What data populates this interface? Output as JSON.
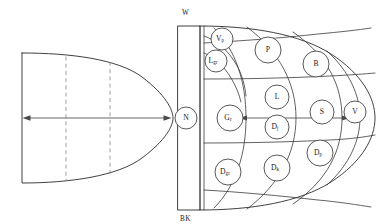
{
  "figure": {
    "caption": "",
    "panels": [
      {
        "id": "left-panel",
        "name": "outline-shape-panel",
        "description": "Rounded-nose outline with two vertical dashed division lines and a horizontal double-headed width arrow"
      },
      {
        "id": "right-panel",
        "name": "segmented-node-panel",
        "description": "Rounded-nose outline subdivided by curved arcs into cells, each containing a labelled circular node, with a left vertical band"
      }
    ]
  },
  "left_diagram": {
    "dashed_line_count": 2,
    "arrow": {
      "type": "double-headed",
      "orientation": "horizontal",
      "label": ""
    }
  },
  "right_diagram": {
    "band_label_top": "W",
    "band_label_bottom": "BK",
    "arrow": {
      "type": "double-headed",
      "orientation": "horizontal",
      "from_node": "G",
      "through_node": "S",
      "to_node": "V"
    },
    "nodes": [
      {
        "id": "n",
        "base": "N",
        "sub": "",
        "cx": 186,
        "cy": 118
      },
      {
        "id": "vp",
        "base": "V",
        "sub": "p",
        "cx": 222,
        "cy": 39
      },
      {
        "id": "lgr",
        "base": "L",
        "sub": "gr",
        "cx": 216,
        "cy": 61
      },
      {
        "id": "p",
        "base": "P",
        "sub": "",
        "cx": 268,
        "cy": 50
      },
      {
        "id": "b",
        "base": "B",
        "sub": "",
        "cx": 316,
        "cy": 64
      },
      {
        "id": "gr",
        "base": "G",
        "sub": "r",
        "cx": 230,
        "cy": 118
      },
      {
        "id": "l",
        "base": "L",
        "sub": "",
        "cx": 277,
        "cy": 97
      },
      {
        "id": "dj",
        "base": "D",
        "sub": "j",
        "cx": 277,
        "cy": 127
      },
      {
        "id": "s",
        "base": "S",
        "sub": "",
        "cx": 322,
        "cy": 112
      },
      {
        "id": "v",
        "base": "V",
        "sub": "",
        "cx": 355,
        "cy": 112
      },
      {
        "id": "dgr",
        "base": "D",
        "sub": "gr",
        "cx": 228,
        "cy": 172
      },
      {
        "id": "dk",
        "base": "D",
        "sub": "k",
        "cx": 277,
        "cy": 168
      },
      {
        "id": "dp",
        "base": "D",
        "sub": "p",
        "cx": 320,
        "cy": 153
      }
    ]
  },
  "colors": {
    "outline": "#2b2b2b",
    "cell_line": "#3a3a3a",
    "dashed": "#8e8e8e",
    "arrow": "#4a4a4a",
    "node_fill": "#ffffff",
    "text": "#1a1a1a",
    "background": "#ffffff"
  }
}
